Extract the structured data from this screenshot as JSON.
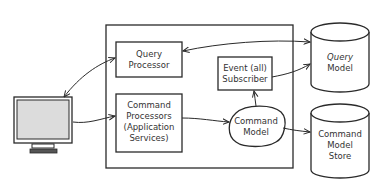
{
  "diagram": {
    "type": "architecture",
    "title": "",
    "nodes": {
      "client": {
        "label": "",
        "kind": "monitor",
        "icon": "monitor-icon"
      },
      "query_processor": {
        "lines": [
          "Query",
          "Processor"
        ],
        "kind": "box"
      },
      "command_processors": {
        "lines": [
          "Command",
          "Processors",
          "(Application",
          "Services)"
        ],
        "kind": "box"
      },
      "event_subscriber": {
        "lines": [
          "Event (all)",
          "Subscriber"
        ],
        "kind": "box"
      },
      "command_model": {
        "lines": [
          "Command",
          "Model"
        ],
        "kind": "blob"
      },
      "query_model": {
        "lines": [
          "Query",
          "Model"
        ],
        "kind": "database"
      },
      "command_model_store": {
        "lines": [
          "Command",
          "Model",
          "Store"
        ],
        "kind": "database"
      }
    },
    "edges": [
      {
        "from": "client",
        "to": "query_processor",
        "direction": "bidirectional"
      },
      {
        "from": "client",
        "to": "command_processors",
        "direction": "forward"
      },
      {
        "from": "query_processor",
        "to": "query_model",
        "direction": "bidirectional"
      },
      {
        "from": "command_processors",
        "to": "command_model",
        "direction": "forward"
      },
      {
        "from": "command_model",
        "to": "event_subscriber",
        "direction": "forward"
      },
      {
        "from": "event_subscriber",
        "to": "query_model",
        "direction": "forward"
      },
      {
        "from": "command_model",
        "to": "command_model_store",
        "direction": "forward"
      }
    ],
    "colors": {
      "stroke": "#2a2a2a",
      "text": "#333333",
      "screen_fill": "#dcdcdc",
      "background": "#ffffff"
    }
  }
}
